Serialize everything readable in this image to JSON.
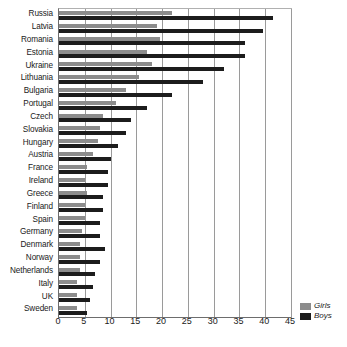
{
  "chart_data": {
    "type": "bar",
    "orientation": "horizontal",
    "title": "",
    "subtitle": "",
    "xlabel": "",
    "ylabel": "",
    "xlim": [
      0,
      45
    ],
    "xticks": [
      0,
      5,
      10,
      15,
      20,
      25,
      30,
      35,
      40,
      45
    ],
    "grid": true,
    "legend_position": "bottom-right",
    "categories": [
      "Russia",
      "Latvia",
      "Romania",
      "Estonia",
      "Ukraine",
      "Lithuania",
      "Bulgaria",
      "Portugal",
      "Czech",
      "Slovakia",
      "Hungary",
      "Austria",
      "France",
      "Ireland",
      "Greece",
      "Finland",
      "Spain",
      "Germany",
      "Denmark",
      "Norway",
      "Netherlands",
      "Italy",
      "UK",
      "Sweden"
    ],
    "series": [
      {
        "name": "Girls",
        "color": "#8c8c8c",
        "values": [
          22.0,
          19.0,
          19.5,
          17.0,
          18.0,
          15.5,
          13.0,
          11.0,
          8.5,
          8.0,
          7.5,
          6.5,
          5.5,
          5.0,
          5.5,
          5.0,
          5.0,
          4.5,
          4.0,
          4.0,
          4.0,
          3.5,
          3.5,
          3.5
        ]
      },
      {
        "name": "Boys",
        "color": "#1c1c1c",
        "values": [
          41.5,
          39.5,
          36.0,
          36.0,
          32.0,
          28.0,
          22.0,
          17.0,
          14.0,
          13.0,
          11.5,
          10.0,
          9.5,
          9.5,
          8.5,
          8.5,
          8.0,
          8.0,
          9.0,
          8.0,
          7.0,
          6.5,
          6.0,
          5.5
        ]
      }
    ]
  },
  "legend": {
    "items": [
      {
        "label": "Girls",
        "swatch_class": "girls"
      },
      {
        "label": "Boys",
        "swatch_class": "boys"
      }
    ]
  },
  "colors": {
    "girls": "#8c8c8c",
    "boys": "#1c1c1c",
    "grid": "#9a9a9a",
    "axis": "#6d6d6d",
    "text": "#1a1a1a",
    "background": "#ffffff"
  }
}
